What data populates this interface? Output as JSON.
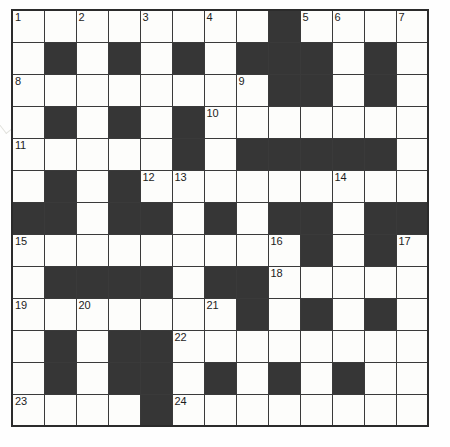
{
  "puzzle": {
    "title": "Crossword Grid",
    "rows": 13,
    "cols": 13,
    "cell_size_px": 32,
    "colors": {
      "block": "#363636",
      "cell": "#fdfdfb",
      "border": "#2b2b2b",
      "number_text": "#1c1c1c"
    },
    "legend": {
      "white_code": 0,
      "black_code": 1
    },
    "grid": [
      [
        0,
        0,
        0,
        0,
        0,
        0,
        0,
        0,
        1,
        0,
        0,
        0,
        0
      ],
      [
        0,
        1,
        0,
        1,
        0,
        1,
        0,
        1,
        1,
        1,
        0,
        1,
        0
      ],
      [
        0,
        0,
        0,
        0,
        0,
        0,
        0,
        0,
        1,
        1,
        0,
        1,
        0
      ],
      [
        0,
        1,
        0,
        1,
        0,
        1,
        0,
        0,
        0,
        0,
        0,
        0,
        0
      ],
      [
        0,
        0,
        0,
        0,
        0,
        1,
        0,
        1,
        1,
        1,
        1,
        1,
        0
      ],
      [
        0,
        1,
        0,
        1,
        0,
        0,
        0,
        0,
        0,
        0,
        0,
        0,
        0
      ],
      [
        1,
        1,
        0,
        1,
        1,
        0,
        1,
        0,
        1,
        1,
        0,
        1,
        1
      ],
      [
        0,
        0,
        0,
        0,
        0,
        0,
        0,
        0,
        0,
        1,
        0,
        1,
        0
      ],
      [
        0,
        1,
        1,
        1,
        1,
        0,
        1,
        1,
        0,
        0,
        0,
        0,
        0
      ],
      [
        0,
        0,
        0,
        0,
        0,
        0,
        0,
        1,
        0,
        1,
        0,
        1,
        0
      ],
      [
        0,
        1,
        0,
        1,
        1,
        0,
        0,
        0,
        0,
        0,
        0,
        0,
        0
      ],
      [
        0,
        1,
        0,
        1,
        1,
        0,
        1,
        0,
        1,
        0,
        1,
        0,
        0
      ],
      [
        0,
        0,
        0,
        0,
        1,
        0,
        0,
        0,
        0,
        0,
        0,
        0,
        0
      ]
    ],
    "numbers": [
      {
        "n": "1",
        "row": 1,
        "col": 1
      },
      {
        "n": "2",
        "row": 1,
        "col": 3
      },
      {
        "n": "3",
        "row": 1,
        "col": 5
      },
      {
        "n": "4",
        "row": 1,
        "col": 7
      },
      {
        "n": "5",
        "row": 1,
        "col": 10
      },
      {
        "n": "6",
        "row": 1,
        "col": 11
      },
      {
        "n": "7",
        "row": 1,
        "col": 13
      },
      {
        "n": "8",
        "row": 3,
        "col": 1
      },
      {
        "n": "9",
        "row": 3,
        "col": 8
      },
      {
        "n": "10",
        "row": 4,
        "col": 7
      },
      {
        "n": "11",
        "row": 5,
        "col": 1
      },
      {
        "n": "12",
        "row": 6,
        "col": 5
      },
      {
        "n": "13",
        "row": 6,
        "col": 6
      },
      {
        "n": "14",
        "row": 6,
        "col": 11
      },
      {
        "n": "15",
        "row": 8,
        "col": 1
      },
      {
        "n": "16",
        "row": 8,
        "col": 9
      },
      {
        "n": "17",
        "row": 8,
        "col": 13
      },
      {
        "n": "18",
        "row": 9,
        "col": 9
      },
      {
        "n": "19",
        "row": 10,
        "col": 1
      },
      {
        "n": "20",
        "row": 10,
        "col": 3
      },
      {
        "n": "21",
        "row": 10,
        "col": 7
      },
      {
        "n": "22",
        "row": 11,
        "col": 6
      },
      {
        "n": "23",
        "row": 13,
        "col": 1
      },
      {
        "n": "24",
        "row": 13,
        "col": 6
      }
    ],
    "entries": []
  }
}
